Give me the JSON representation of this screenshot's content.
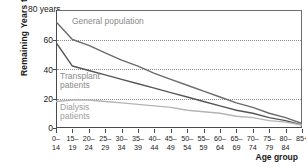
{
  "chart_data": {
    "type": "line",
    "title": "",
    "xlabel": "Age group",
    "ylabel": "Remaining Years to Live",
    "y_unit_label": "80 years",
    "ylim": [
      0,
      80
    ],
    "yticks": [
      0,
      20,
      40,
      60,
      80
    ],
    "ytick_labels": [
      "0",
      "20",
      "40",
      "60",
      "80"
    ],
    "grid": "horizontal-dotted",
    "legend": "inline-labels",
    "categories": [
      "0–14",
      "15–19",
      "20–24",
      "25–29",
      "30–34",
      "35–39",
      "40–44",
      "45–49",
      "50–54",
      "55–59",
      "60–64",
      "65–69",
      "70–74",
      "75–79",
      "80–84",
      "85+"
    ],
    "xtick_top": [
      "0–",
      "15–",
      "20–",
      "25–",
      "30–",
      "35–",
      "40–",
      "45–",
      "50–",
      "55–",
      "60–",
      "65–",
      "70–",
      "75–",
      "80–",
      "85+"
    ],
    "xtick_bottom": [
      "14",
      "19",
      "24",
      "29",
      "34",
      "39",
      "44",
      "49",
      "54",
      "59",
      "64",
      "69",
      "74",
      "79",
      "84",
      ""
    ],
    "series": [
      {
        "name": "General population",
        "color": "#6b6b6b",
        "values": [
          72,
          60,
          56,
          51,
          46,
          42,
          37,
          33,
          29,
          25,
          21,
          17,
          14,
          10,
          7,
          3
        ]
      },
      {
        "name": "Transplant patients",
        "color": "#565656",
        "values": [
          58,
          42,
          39,
          36,
          33,
          30,
          27,
          24,
          21,
          18,
          15,
          12,
          10,
          7,
          5,
          2
        ]
      },
      {
        "name": "Dialysis patients",
        "color": "#b4b4b4",
        "values": [
          18,
          19,
          19,
          18,
          17,
          16,
          15,
          14,
          12,
          11,
          10,
          8,
          7,
          5,
          4,
          2
        ]
      }
    ],
    "annotations": [
      {
        "text": "General population",
        "series": "General population"
      },
      {
        "text": "Transplant",
        "series": "Transplant patients"
      },
      {
        "text": "patients",
        "series": "Transplant patients"
      },
      {
        "text": "Dialysis",
        "series": "Dialysis patients"
      },
      {
        "text": "patients",
        "series": "Dialysis patients"
      }
    ]
  }
}
